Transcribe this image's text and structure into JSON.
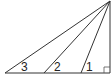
{
  "diagram": {
    "type": "geometry",
    "stroke_color": "#333333",
    "apex": {
      "x": 110,
      "y": 1
    },
    "right_angle_vertex": {
      "x": 110,
      "y": 73
    },
    "base_points": [
      {
        "id": "left",
        "x": 5,
        "y": 73
      },
      {
        "id": "mid",
        "x": 44,
        "y": 73
      },
      {
        "id": "right",
        "x": 81,
        "y": 73
      }
    ],
    "angle_labels": [
      {
        "label": "3",
        "x": 21,
        "y": 71
      },
      {
        "label": "2",
        "x": 54,
        "y": 71
      },
      {
        "label": "1",
        "x": 86,
        "y": 71
      }
    ],
    "right_angle_marker": {
      "size": 6
    }
  }
}
